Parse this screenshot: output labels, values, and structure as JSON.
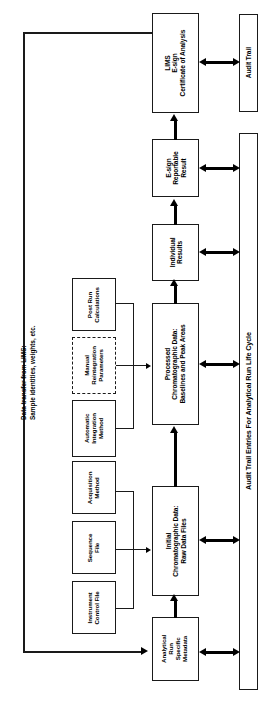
{
  "diagram": {
    "title": "Audit Trail Entries For Analytical Run Life Cycle",
    "orientation": "rotated-90-ccw",
    "caption": {
      "line1": "Data transfer from LIMS:",
      "line2": "Sample identities, weights, etc."
    },
    "nodes": {
      "lims": {
        "line1": "LIMS",
        "line2": "E-sign",
        "line3": "Certificate of Analysis"
      },
      "audit_trail": {
        "label": "Audit Trail"
      },
      "audit_trail_entries": {
        "label": "Audit Trail Entries For Analytical Run Life Cycle"
      },
      "esign_reportable": {
        "line1": "E-sign",
        "line2": "Reportable",
        "line3": "Result"
      },
      "individual_results": {
        "line1": "Individual",
        "line2": "Results"
      },
      "post_run": {
        "line1": "Post Run",
        "line2": "Calculations"
      },
      "manual_reintegration": {
        "line1": "Manual",
        "line2": "Reintegration",
        "line3": "Parameters"
      },
      "automatic_integration": {
        "line1": "Automatic",
        "line2": "Integration",
        "line3": "Method"
      },
      "processed_data": {
        "line1": "Processed",
        "line2": "Chromatographic Data:",
        "line3": "Baselines and Peak Areas"
      },
      "acquisition_method": {
        "line1": "Acquisition",
        "line2": "Method"
      },
      "sequence_file": {
        "line1": "Sequence",
        "line2": "File"
      },
      "instrument_control_file": {
        "line1": "Instrument",
        "line2": "Control File"
      },
      "initial_data": {
        "line1": "Initial",
        "line2": "Chromatographic Data:",
        "line3": "Raw Data Files"
      },
      "analytical_metadata": {
        "line1": "Analytical",
        "line2": "Run",
        "line3": "Specific",
        "line4": "Metadata"
      }
    },
    "colors": {
      "stroke": "#1a1a1a",
      "fill": "#ffffff",
      "text": "#000000"
    }
  }
}
